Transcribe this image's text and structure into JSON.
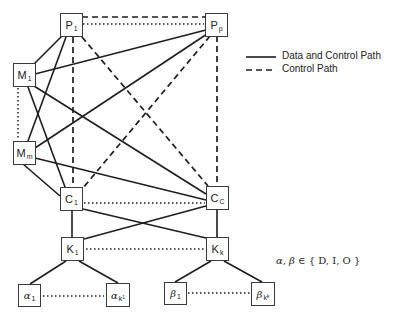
{
  "diagram": {
    "nodes": {
      "p1": {
        "base": "P",
        "sub": "1"
      },
      "pp": {
        "base": "P",
        "sub": "p"
      },
      "m1": {
        "base": "M",
        "sub": "1"
      },
      "mm": {
        "base": "M",
        "sub": "m"
      },
      "c1": {
        "base": "C",
        "sub": "1"
      },
      "cc": {
        "base": "C",
        "sub": "C"
      },
      "k1": {
        "base": "K",
        "sub": "1"
      },
      "kk": {
        "base": "K",
        "sub": "k"
      },
      "alpha1": {
        "base": "α",
        "sub": "1"
      },
      "alphak1": {
        "base": "α",
        "sub": "k",
        "subsub": "1"
      },
      "beta1": {
        "base": "β",
        "sub": "1"
      },
      "betakk": {
        "base": "β",
        "sub": "k",
        "subsub": "k"
      }
    },
    "legend": {
      "solid_label": "Data and Control Path",
      "dashed_label": "Control Path"
    },
    "set_note": {
      "vars": "α, β",
      "symbol": " ∈ ",
      "set": "{ D, I, O }"
    },
    "colors": {
      "line": "#1e1e1e",
      "box_border": "#3a3a3a"
    }
  }
}
